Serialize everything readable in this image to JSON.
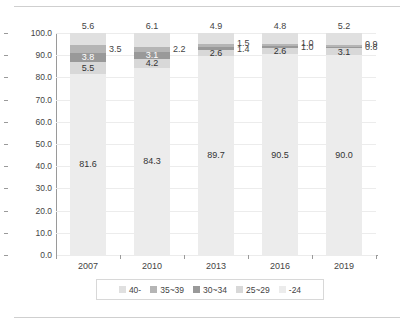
{
  "chart_data": {
    "type": "bar",
    "subtype": "stacked-100",
    "title": "",
    "xlabel": "",
    "ylabel": "",
    "ylim": [
      0,
      100
    ],
    "ytick_step": 10,
    "ytick_labels": [
      "0.0",
      "10.0",
      "20.0",
      "30.0",
      "40.0",
      "50.0",
      "60.0",
      "70.0",
      "80.0",
      "90.0",
      "100.0"
    ],
    "grid": true,
    "legend_position": "bottom",
    "categories": [
      "2007",
      "2010",
      "2013",
      "2016",
      "2019"
    ],
    "series": [
      {
        "name": "-24",
        "color": "#ececec",
        "values": [
          81.6,
          84.3,
          89.7,
          90.5,
          90.0
        ]
      },
      {
        "name": "25~29",
        "color": "#d8d8d8",
        "values": [
          5.5,
          4.2,
          2.6,
          2.6,
          3.1
        ]
      },
      {
        "name": "30~34",
        "color": "#999999",
        "values": [
          3.8,
          3.1,
          1.4,
          1.0,
          0.8
        ]
      },
      {
        "name": "35~39",
        "color": "#b5b5b5",
        "values": [
          3.5,
          2.2,
          1.5,
          1.0,
          0.9
        ]
      },
      {
        "name": "40-",
        "color": "#e0e0e0",
        "values": [
          5.6,
          6.1,
          4.9,
          4.8,
          5.2
        ]
      }
    ],
    "legend_entries": [
      {
        "label": "40-",
        "color": "#e0e0e0"
      },
      {
        "label": "35~39",
        "color": "#b5b5b5"
      },
      {
        "label": "30~34",
        "color": "#999999"
      },
      {
        "label": "25~29",
        "color": "#d8d8d8"
      },
      {
        "label": "-24",
        "color": "#ececec"
      }
    ],
    "data_labels": {
      "2007": {
        "-24": "81.6",
        "25~29": "5.5",
        "30~34": "3.8",
        "35~39": "3.5",
        "40-": "5.6"
      },
      "2010": {
        "-24": "84.3",
        "25~29": "4.2",
        "30~34": "3.1",
        "35~39": "2.2",
        "40-": "6.1"
      },
      "2013": {
        "-24": "89.7",
        "25~29": "2.6",
        "30~34": "1.4",
        "35~39": "1.5",
        "40-": "4.9"
      },
      "2016": {
        "-24": "90.5",
        "25~29": "2.6",
        "30~34": "1.0",
        "35~39": "1.0",
        "40-": "4.8"
      },
      "2019": {
        "-24": "90.0",
        "25~29": "3.1",
        "30~34": "0.8",
        "35~39": "0.9",
        "40-": "5.2"
      }
    }
  }
}
